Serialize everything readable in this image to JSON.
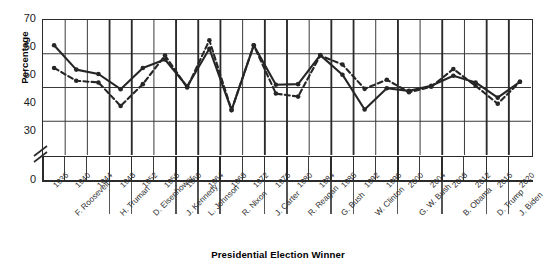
{
  "chart_data": {
    "type": "line",
    "title": "",
    "xlabel": "Presidential Election Winner",
    "ylabel": "Percentage",
    "ylim": [
      0,
      70
    ],
    "yticks": [
      0,
      30,
      40,
      50,
      60,
      70
    ],
    "y_axis_break": true,
    "y_axis_break_between": [
      0,
      30
    ],
    "grid": true,
    "legend": "none",
    "categories": [
      "1936",
      "1940",
      "1944",
      "1948",
      "1952",
      "1956",
      "1960",
      "1964",
      "1968",
      "1972",
      "1976",
      "1980",
      "1984",
      "1988",
      "1992",
      "1996",
      "2000",
      "2004",
      "2008",
      "2012",
      "2016",
      "2020"
    ],
    "group_labels": [
      {
        "label": "F. Roosevelt",
        "years": [
          "1936",
          "1940",
          "1944"
        ]
      },
      {
        "label": "H. Truman",
        "years": [
          "1948"
        ]
      },
      {
        "label": "D. Eisenhower",
        "years": [
          "1952",
          "1956"
        ]
      },
      {
        "label": "J. Kennedy",
        "years": [
          "1960"
        ]
      },
      {
        "label": "L. Johnson",
        "years": [
          "1964"
        ]
      },
      {
        "label": "R. Nixon",
        "years": [
          "1968",
          "1972"
        ]
      },
      {
        "label": "J. Carter",
        "years": [
          "1976"
        ]
      },
      {
        "label": "R. Reagan",
        "years": [
          "1980",
          "1984"
        ]
      },
      {
        "label": "G. Bush",
        "years": [
          "1988"
        ]
      },
      {
        "label": "W. Clinton",
        "years": [
          "1992",
          "1996"
        ]
      },
      {
        "label": "G. W. Bush",
        "years": [
          "2000",
          "2004"
        ]
      },
      {
        "label": "B. Obama",
        "years": [
          "2008",
          "2012"
        ]
      },
      {
        "label": "D. Trump",
        "years": [
          "2016"
        ]
      },
      {
        "label": "J. Biden",
        "years": [
          "2020"
        ]
      }
    ],
    "series": [
      {
        "name": "solid",
        "style": "solid",
        "color": "#262626",
        "values": [
          62.5,
          55.3,
          54.0,
          49.5,
          55.8,
          58.3,
          50.3,
          61.5,
          43.3,
          62.5,
          50.8,
          51.0,
          59.6,
          53.8,
          43.5,
          49.8,
          49.0,
          50.5,
          53.5,
          51.5,
          47.0,
          51.7
        ]
      },
      {
        "name": "dashed",
        "style": "dashed",
        "color": "#262626",
        "values": [
          55.8,
          52.0,
          51.5,
          44.5,
          51.0,
          59.5,
          50.0,
          64.0,
          43.3,
          62.5,
          48.2,
          47.3,
          59.5,
          56.8,
          49.6,
          52.3,
          48.6,
          50.2,
          55.5,
          50.5,
          45.2,
          51.7
        ]
      }
    ]
  },
  "axis": {
    "y_title": "Percentage",
    "x_title": "Presidential Election Winner",
    "ytick_labels": [
      "70",
      "60",
      "50",
      "40",
      "30",
      "0"
    ]
  }
}
